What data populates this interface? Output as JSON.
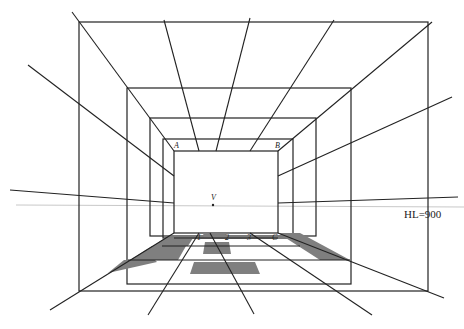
{
  "diagram": {
    "colors": {
      "line": "#222222",
      "horizon": "#c8c8c8",
      "tile": "#7f7f7f",
      "background": "#ffffff"
    },
    "horizon_label": "HL=900",
    "vanishing_point_label": "V",
    "corner_labels": {
      "top_left": "A",
      "top_right": "B",
      "bottom_left_floor": "1",
      "bottom_mid_floor_a": "2",
      "bottom_mid_floor_b": "3",
      "bottom_right": "C"
    }
  }
}
